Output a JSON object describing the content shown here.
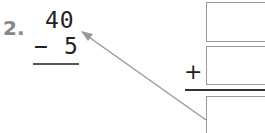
{
  "problem": {
    "number": "2.",
    "top": "40",
    "bottom": "5",
    "operator": "−"
  },
  "addition_frame": {
    "operator": "+",
    "boxes": [
      "",
      "",
      ""
    ]
  },
  "arrow": {
    "color": "#999999"
  }
}
